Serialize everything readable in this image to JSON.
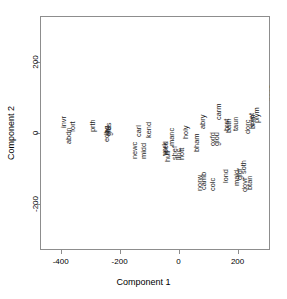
{
  "chart_data": {
    "type": "scatter",
    "title": "",
    "xlabel": "Component 1",
    "ylabel": "Component 2",
    "xlim": [
      -470,
      310
    ],
    "ylim": [
      -330,
      330
    ],
    "xticks": [
      -400,
      -200,
      0,
      200
    ],
    "xticklabels": [
      "-400",
      "-200",
      "0",
      "200"
    ],
    "yticks": [
      200,
      0,
      -200
    ],
    "yticklabels": [
      "200",
      "0",
      "-200"
    ],
    "grid": false,
    "legend": null,
    "marker": "text-label",
    "label_rotation": 90,
    "points": [
      {
        "label": "invr",
        "x": -413,
        "y": 30
      },
      {
        "label": "abdn",
        "x": -398,
        "y": -8
      },
      {
        "label": "fort",
        "x": -382,
        "y": 18
      },
      {
        "label": "prth",
        "x": -315,
        "y": 22
      },
      {
        "label": "edbg",
        "x": -268,
        "y": -4
      },
      {
        "label": "glas",
        "x": -262,
        "y": 12
      },
      {
        "label": "strl",
        "x": -264,
        "y": 6
      },
      {
        "label": "carl",
        "x": -160,
        "y": 6
      },
      {
        "label": "newc",
        "x": -172,
        "y": -48
      },
      {
        "label": "midd",
        "x": -142,
        "y": -50
      },
      {
        "label": "kend",
        "x": -125,
        "y": 8
      },
      {
        "label": "hull",
        "x": -62,
        "y": -66
      },
      {
        "label": "york",
        "x": -70,
        "y": -44
      },
      {
        "label": "leed",
        "x": -68,
        "y": -42
      },
      {
        "label": "manc",
        "x": -48,
        "y": -10
      },
      {
        "label": "shef",
        "x": -38,
        "y": -56
      },
      {
        "label": "linc",
        "x": -24,
        "y": -62
      },
      {
        "label": "nott",
        "x": -14,
        "y": -58
      },
      {
        "label": "holy",
        "x": -2,
        "y": 4
      },
      {
        "label": "bham",
        "x": 38,
        "y": -26
      },
      {
        "label": "abry",
        "x": 58,
        "y": 30
      },
      {
        "label": "norw",
        "x": 48,
        "y": -140
      },
      {
        "label": "camb",
        "x": 62,
        "y": -134
      },
      {
        "label": "colc",
        "x": 92,
        "y": -144
      },
      {
        "label": "oxfd",
        "x": 92,
        "y": -18
      },
      {
        "label": "glou",
        "x": 104,
        "y": -16
      },
      {
        "label": "carm",
        "x": 112,
        "y": 60
      },
      {
        "label": "brst",
        "x": 140,
        "y": 22
      },
      {
        "label": "bath",
        "x": 144,
        "y": 20
      },
      {
        "label": "lond",
        "x": 134,
        "y": -120
      },
      {
        "label": "taun",
        "x": 168,
        "y": 26
      },
      {
        "label": "maid",
        "x": 172,
        "y": -128
      },
      {
        "label": "gldf",
        "x": 184,
        "y": -116
      },
      {
        "label": "soth",
        "x": 196,
        "y": -96
      },
      {
        "label": "dovr",
        "x": 200,
        "y": -146
      },
      {
        "label": "btan",
        "x": 216,
        "y": -142
      },
      {
        "label": "dorc",
        "x": 210,
        "y": 18
      },
      {
        "label": "exet",
        "x": 224,
        "y": 36
      },
      {
        "label": "bnm",
        "x": 226,
        "y": 30
      },
      {
        "label": "plym",
        "x": 240,
        "y": 50
      },
      {
        "label": "penz",
        "x": 292,
        "y": 112
      }
    ]
  }
}
